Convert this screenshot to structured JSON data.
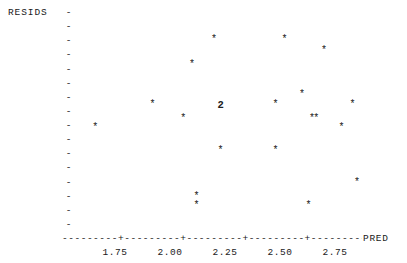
{
  "header": {
    "clipped_text": "                    "
  },
  "axes": {
    "y_label": "RESIDS",
    "x_label": "PRED",
    "y_tick_labels": [
      "1.2+",
      "0.0+",
      "-1.2+"
    ],
    "y_minor_glyph": "-",
    "x_tick_labels": [
      "1.75",
      "2.00",
      "2.25",
      "2.50",
      "2.75"
    ],
    "x_axis_dashes": "---------+---------+---------+---------+---------+--------"
  },
  "chart_data": {
    "type": "scatter",
    "title": "",
    "xlabel": "PRED",
    "ylabel": "RESIDS",
    "xlim": [
      1.58,
      2.93
    ],
    "ylim": [
      -2.1,
      2.1
    ],
    "xticks": [
      1.75,
      2.0,
      2.25,
      2.5,
      2.75
    ],
    "yticks": [
      1.2,
      0.0,
      -1.2
    ],
    "y_minor_tick_step": 0.3,
    "grid": false,
    "legend": false,
    "marker_glyph": "*",
    "overlap_glyph": "2",
    "points": [
      {
        "x": 1.66,
        "y": -0.2,
        "glyph": "*",
        "count": 1
      },
      {
        "x": 1.92,
        "y": 0.3,
        "glyph": "*",
        "count": 1
      },
      {
        "x": 2.06,
        "y": 0.0,
        "glyph": "*",
        "count": 1
      },
      {
        "x": 2.1,
        "y": 1.15,
        "glyph": "*",
        "count": 1
      },
      {
        "x": 2.12,
        "y": -1.65,
        "glyph": "*",
        "count": 1
      },
      {
        "x": 2.12,
        "y": -1.85,
        "glyph": "*",
        "count": 1
      },
      {
        "x": 2.2,
        "y": 1.68,
        "glyph": "*",
        "count": 1
      },
      {
        "x": 2.23,
        "y": 0.3,
        "glyph": "2",
        "count": 2
      },
      {
        "x": 2.23,
        "y": -0.68,
        "glyph": "*",
        "count": 1
      },
      {
        "x": 2.48,
        "y": -0.68,
        "glyph": "*",
        "count": 1
      },
      {
        "x": 2.48,
        "y": 0.3,
        "glyph": "*",
        "count": 1
      },
      {
        "x": 2.52,
        "y": 1.68,
        "glyph": "*",
        "count": 1
      },
      {
        "x": 2.6,
        "y": 0.5,
        "glyph": "*",
        "count": 1
      },
      {
        "x": 2.63,
        "y": -1.85,
        "glyph": "*",
        "count": 1
      },
      {
        "x": 2.645,
        "y": 0.0,
        "glyph": "*",
        "count": 1
      },
      {
        "x": 2.665,
        "y": 0.0,
        "glyph": "*",
        "count": 1
      },
      {
        "x": 2.7,
        "y": 1.45,
        "glyph": "*",
        "count": 1
      },
      {
        "x": 2.78,
        "y": -0.2,
        "glyph": "*",
        "count": 1
      },
      {
        "x": 2.83,
        "y": 0.3,
        "glyph": "*",
        "count": 1
      },
      {
        "x": 2.85,
        "y": -1.35,
        "glyph": "*",
        "count": 1
      }
    ]
  },
  "colors": {
    "ink": "#1a1a1a",
    "marker": "#202020",
    "background": "#ffffff"
  }
}
